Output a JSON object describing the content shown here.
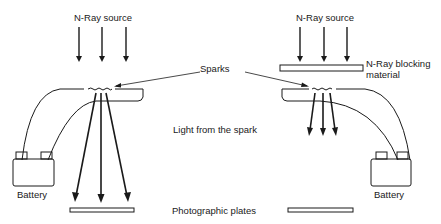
{
  "labels": {
    "source_left": "N-Ray source",
    "source_right": "N-Ray source",
    "blocking_line1": "N-Ray blocking",
    "blocking_line2": "material",
    "sparks": "Sparks",
    "light": "Light from the spark",
    "battery_left": "Battery",
    "battery_right": "Battery",
    "plates": "Photographic plates"
  },
  "colors": {
    "ink": "#1a1a1a",
    "background": "#ffffff"
  }
}
